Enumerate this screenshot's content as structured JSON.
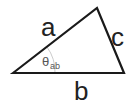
{
  "diagram": {
    "type": "triangle",
    "stroke_color": "#1a1a1a",
    "arc_color": "#bbbbbb",
    "vertices": {
      "left": [
        13,
        73
      ],
      "apex": [
        97,
        8
      ],
      "right": [
        124,
        73
      ]
    },
    "labels": {
      "side_a": "a",
      "side_b": "b",
      "side_c": "c",
      "angle_symbol": "θ",
      "angle_subscript": "ab"
    }
  }
}
